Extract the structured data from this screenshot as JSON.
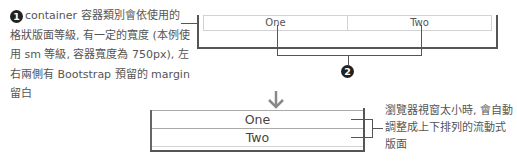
{
  "callout_1": {
    "badge": "1",
    "text": "container 容器類別會依使用的格狀版面等級, 有一定的寬度 (本例使用 sm 等級, 容器寬度為 750px), 左右兩側有 Bootstrap 預留的 margin 留白"
  },
  "wide_layout": {
    "columns": [
      "One",
      "Two"
    ]
  },
  "callout_2": {
    "badge": "2"
  },
  "transition": {
    "icon": "arrow-down-icon"
  },
  "narrow_layout": {
    "rows": [
      "One",
      "Two"
    ]
  },
  "callout_right": {
    "text": "瀏覽器視窗太小時, 會自動調整成上下排列的流動式版面"
  },
  "colors": {
    "bracket": "#555555",
    "cell_border": "#d2d2d2",
    "badge_bg": "#222222",
    "arrow": "#888888"
  }
}
